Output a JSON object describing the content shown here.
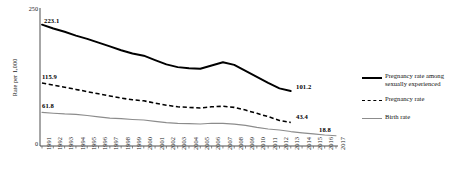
{
  "chart_data": {
    "type": "line",
    "title": "",
    "xlabel": "",
    "ylabel": "Rate per 1,000",
    "ylim": [
      0,
      250
    ],
    "yticks": [
      "0",
      "250"
    ],
    "grid": false,
    "legend_position": "right",
    "categories": [
      "1991",
      "1992",
      "1993",
      "1994",
      "1995",
      "1996",
      "1997",
      "1998",
      "1999",
      "2000",
      "2001",
      "2002",
      "2003",
      "2004",
      "2005",
      "2006",
      "2007",
      "2008",
      "2009",
      "2010",
      "2011",
      "2012",
      "2013",
      "2014",
      "2015",
      "2016",
      "2017"
    ],
    "series": [
      {
        "name": "Pregnancy rate among sexually experienced",
        "style": "solid-thick",
        "color": "#000000",
        "x": [
          "1991",
          "1992",
          "1993",
          "1994",
          "1995",
          "1996",
          "1997",
          "1998",
          "1999",
          "2000",
          "2001",
          "2002",
          "2003",
          "2004",
          "2005",
          "2006",
          "2007",
          "2008",
          "2009",
          "2010",
          "2011",
          "2012",
          "2013"
        ],
        "values": [
          223.1,
          216.0,
          210.0,
          203.0,
          197.0,
          190.0,
          183.0,
          176.0,
          170.0,
          166.0,
          158.0,
          150.0,
          145.0,
          143.0,
          142.0,
          148.0,
          154.0,
          149.0,
          138.0,
          127.0,
          116.0,
          106.0,
          101.2
        ],
        "start_label": "223.1",
        "end_label": "101.2"
      },
      {
        "name": "Pregnancy rate",
        "style": "dashed",
        "color": "#000000",
        "x": [
          "1991",
          "1992",
          "1993",
          "1994",
          "1995",
          "1996",
          "1997",
          "1998",
          "1999",
          "2000",
          "2001",
          "2002",
          "2003",
          "2004",
          "2005",
          "2006",
          "2007",
          "2008",
          "2009",
          "2010",
          "2011",
          "2012",
          "2013"
        ],
        "values": [
          115.9,
          112.0,
          108.0,
          104.0,
          100.0,
          96.0,
          92.0,
          88.0,
          85.0,
          83.0,
          79.0,
          75.0,
          72.0,
          71.0,
          70.0,
          72.0,
          73.0,
          71.0,
          66.0,
          60.0,
          54.0,
          47.0,
          43.4
        ],
        "start_label": "115.9",
        "end_label": "43.4"
      },
      {
        "name": "Birth rate",
        "style": "solid-gray",
        "color": "#8c8c8c",
        "x": [
          "1991",
          "1992",
          "1993",
          "1994",
          "1995",
          "1996",
          "1997",
          "1998",
          "1999",
          "2000",
          "2001",
          "2002",
          "2003",
          "2004",
          "2005",
          "2006",
          "2007",
          "2008",
          "2009",
          "2010",
          "2011",
          "2012",
          "2013",
          "2014",
          "2015",
          "2016",
          "2017"
        ],
        "values": [
          61.8,
          60.3,
          59.0,
          58.2,
          56.0,
          53.5,
          51.3,
          50.3,
          48.8,
          47.7,
          45.3,
          43.0,
          41.6,
          41.1,
          40.5,
          41.9,
          41.5,
          40.2,
          37.9,
          34.2,
          31.3,
          29.4,
          26.5,
          24.2,
          22.3,
          20.3,
          18.8
        ],
        "start_label": "61.8",
        "end_label": "18.8"
      }
    ]
  },
  "legend": {
    "items": [
      {
        "label": "Pregnancy rate among\nsexually experienced",
        "style": "solid-thick"
      },
      {
        "label": "Pregnancy rate",
        "style": "dashed"
      },
      {
        "label": "Birth rate",
        "style": "solid-gray"
      }
    ]
  },
  "axis": {
    "y_label": "Rate per 1,000",
    "y_max": "250",
    "y_min": "0"
  },
  "labels": {
    "l_223": "223.1",
    "l_101": "101.2",
    "l_115": "115.9",
    "l_43": "43.4",
    "l_61": "61.8",
    "l_188": "18.8"
  }
}
